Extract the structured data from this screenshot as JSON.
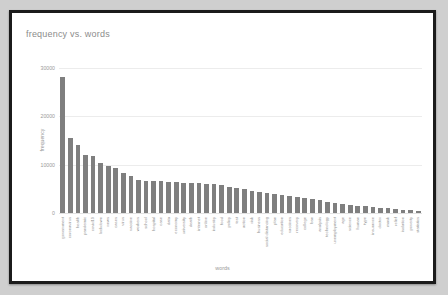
{
  "chart_data": {
    "type": "bar",
    "title": "frequency vs. words",
    "xlabel": "words",
    "ylabel": "frequency",
    "ylim": [
      0,
      32000
    ],
    "yticks": [
      0,
      10000,
      20000,
      30000
    ],
    "ytick_labels": [
      "0",
      "10000",
      "20000",
      "30000"
    ],
    "grid": true,
    "legend": null,
    "bar_color": "#7f7f7f",
    "categories": [
      "government",
      "coronavirus",
      "health",
      "pandemic",
      "covid19",
      "lockdown",
      "news",
      "cases",
      "virus",
      "vaccine",
      "workers",
      "school",
      "hospital",
      "case",
      "data",
      "economy",
      "university",
      "death",
      "internet",
      "online",
      "industry",
      "food",
      "policy",
      "test",
      "action",
      "risk",
      "business",
      "social distancing",
      "plan",
      "education",
      "vaccines",
      "recovery",
      "college",
      "ban",
      "analysis",
      "technology",
      "unemployment",
      "age",
      "science",
      "human",
      "type",
      "insurance",
      "doctor",
      "mask",
      "relief",
      "isolation",
      "poverty",
      "statistics"
    ],
    "values": [
      28200,
      15600,
      14200,
      12100,
      12000,
      10600,
      9900,
      9400,
      8400,
      7900,
      7000,
      6900,
      6900,
      6800,
      6700,
      6600,
      6500,
      6400,
      6300,
      6200,
      6100,
      5900,
      5600,
      5300,
      5100,
      4800,
      4600,
      4400,
      4200,
      4000,
      3800,
      3600,
      3300,
      3000,
      2800,
      2500,
      2300,
      2100,
      1900,
      1750,
      1600,
      1450,
      1300,
      1150,
      1000,
      900,
      800,
      700
    ]
  }
}
